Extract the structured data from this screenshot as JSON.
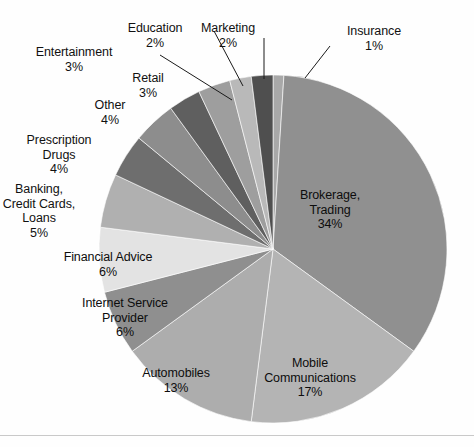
{
  "chart_data": {
    "type": "pie",
    "title": "",
    "units": "percent",
    "start_angle_deg": -90,
    "direction": "clockwise",
    "total": 100,
    "categories": [
      "Insurance",
      "Brokerage, Trading",
      "Mobile Communications",
      "Automobiles",
      "Internet Service Provider",
      "Financial Advice",
      "Banking, Credit Cards, Loans",
      "Prescription Drugs",
      "Other",
      "Retail",
      "Entertainment",
      "Education",
      "Marketing"
    ],
    "values": [
      1,
      34,
      17,
      13,
      6,
      6,
      5,
      4,
      4,
      3,
      3,
      2,
      2
    ],
    "colors": [
      "#a8a8a8",
      "#909090",
      "#b4b4b4",
      "#adadad",
      "#8f8f8f",
      "#e3e3e3",
      "#b0b0b0",
      "#6e6e6e",
      "#8d8d8d",
      "#5f5f5f",
      "#9e9e9e",
      "#b9b9b9",
      "#4f4f4f"
    ],
    "legend": "none",
    "grid": false
  },
  "geometry": {
    "center_x": 273,
    "center_y": 249,
    "radius": 174
  },
  "slices": [
    {
      "name": "insurance",
      "label": "Insurance",
      "percent": "1%",
      "color": "#a8a8a8",
      "placement": "callout",
      "label_x": 374,
      "label_y": 24,
      "align": "center",
      "leader": "M 305,78 L 330,46"
    },
    {
      "name": "brokerage-trading",
      "label_line1": "Brokerage,",
      "label_line2": "Trading",
      "percent": "34%",
      "color": "#909090",
      "placement": "inside",
      "label_x": 330,
      "label_y": 188,
      "align": "center"
    },
    {
      "name": "mobile-communications",
      "label_line1": "Mobile",
      "label_line2": "Communications",
      "percent": "17%",
      "color": "#b4b4b4",
      "placement": "inside",
      "label_x": 310,
      "label_y": 356,
      "align": "center"
    },
    {
      "name": "automobiles",
      "label": "Automobiles",
      "percent": "13%",
      "color": "#adadad",
      "placement": "inside",
      "label_x": 176,
      "label_y": 366,
      "align": "center"
    },
    {
      "name": "internet-service-provider",
      "label_line1": "Internet Service",
      "label_line2": "Provider",
      "percent": "6%",
      "color": "#8f8f8f",
      "placement": "inside",
      "label_x": 125,
      "label_y": 296,
      "align": "center"
    },
    {
      "name": "financial-advice",
      "label": "Financial Advice",
      "percent": "6%",
      "color": "#e3e3e3",
      "placement": "inside",
      "label_x": 108,
      "label_y": 250,
      "align": "center"
    },
    {
      "name": "banking-credit-cards-loans",
      "label_line1": "Banking,",
      "label_line2": "Credit Cards,",
      "label_line3": "Loans",
      "percent": "5%",
      "color": "#b0b0b0",
      "placement": "outside",
      "label_x": 39,
      "label_y": 182,
      "align": "center"
    },
    {
      "name": "prescription-drugs",
      "label_line1": "Prescription",
      "label_line2": "Drugs",
      "percent": "4%",
      "color": "#6e6e6e",
      "placement": "outside",
      "label_x": 59,
      "label_y": 133,
      "align": "center"
    },
    {
      "name": "other",
      "label": "Other",
      "percent": "4%",
      "color": "#8d8d8d",
      "placement": "outside",
      "label_x": 110,
      "label_y": 98,
      "align": "center"
    },
    {
      "name": "retail",
      "label": "Retail",
      "percent": "3%",
      "color": "#5f5f5f",
      "placement": "outside",
      "label_x": 148,
      "label_y": 71,
      "align": "center"
    },
    {
      "name": "entertainment",
      "label": "Entertainment",
      "percent": "3%",
      "color": "#9e9e9e",
      "placement": "callout",
      "label_x": 74,
      "label_y": 45,
      "align": "center",
      "leader": "M 232,100 L 160,55"
    },
    {
      "name": "education",
      "label": "Education",
      "percent": "2%",
      "color": "#b9b9b9",
      "placement": "callout",
      "label_x": 155,
      "label_y": 21,
      "align": "center",
      "leader": "M 243,86 L 214,31"
    },
    {
      "name": "marketing",
      "label": "Marketing",
      "percent": "2%",
      "color": "#4f4f4f",
      "placement": "callout",
      "label_x": 228,
      "label_y": 21,
      "align": "center",
      "leader": "M 264,79 L 264,38"
    }
  ]
}
